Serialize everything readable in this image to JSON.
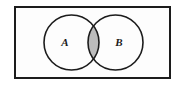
{
  "figure": {
    "type": "venn-diagram",
    "universe": {
      "shape": "rectangle",
      "label": "",
      "x": 14,
      "y": 6,
      "width": 157,
      "height": 73,
      "stroke_color": "#1c1c1c",
      "stroke_width": 2,
      "fill_color": "#fdfdfd"
    },
    "sets": [
      {
        "label": "A",
        "name": "set-a",
        "cx": 71.5,
        "cy": 42.5,
        "r": 27.5,
        "label_x": 65,
        "label_y": 46,
        "stroke_color": "#1c1c1c",
        "stroke_width": 1.6,
        "fill_color": "#fdfdfd"
      },
      {
        "label": "B",
        "name": "set-b",
        "cx": 115.5,
        "cy": 42.5,
        "r": 27.5,
        "label_x": 119,
        "label_y": 46,
        "stroke_color": "#1c1c1c",
        "stroke_width": 1.6,
        "fill_color": "#fdfdfd"
      }
    ],
    "intersection": {
      "name": "a-intersect-b",
      "shaded": true,
      "fill_color": "#bcbcbc",
      "top_tip_y": 22,
      "bottom_tip_y": 63,
      "left_x": 88,
      "right_x": 99
    },
    "background_color": "#ffffff"
  }
}
